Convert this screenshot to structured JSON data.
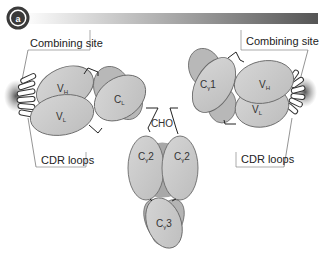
{
  "header": {
    "badge_letter": "a",
    "badge_color": "#3a3a3a",
    "bar_gradient": [
      "#ffffff",
      "#555555"
    ]
  },
  "labels": {
    "combining_site_left": "Combining site",
    "combining_site_right": "Combining site",
    "cdr_loops_left": "CDR loops",
    "cdr_loops_right": "CDR loops",
    "cho": "CHO"
  },
  "domains": {
    "vh_left": {
      "main": "V",
      "sub": "H"
    },
    "vl_left": {
      "main": "V",
      "sub": "L"
    },
    "cl_left": {
      "main": "C",
      "sub": "L"
    },
    "cg1_right": {
      "main": "C",
      "sub": "γ",
      "suffix": "1"
    },
    "vh_right": {
      "main": "V",
      "sub": "H"
    },
    "vl_right": {
      "main": "V",
      "sub": "L"
    },
    "cg2_left": {
      "main": "C",
      "sub": "γ",
      "suffix": "2"
    },
    "cg2_right": {
      "main": "C",
      "sub": "γ",
      "suffix": "2"
    },
    "cg3": {
      "main": "C",
      "sub": "γ",
      "suffix": "3"
    }
  },
  "colors": {
    "domain_fill": "#c8c8c8",
    "domain_back_fill": "#b4b4b4",
    "domain_stroke": "#6a6a6a",
    "hinge_fill": "#a8a8a8",
    "antigen_shadow": "#555555"
  }
}
